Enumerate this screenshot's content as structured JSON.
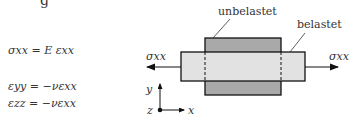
{
  "top_fragment": "g",
  "equations": {
    "stress": "σxx = E εxx",
    "strain_yy": "εyy = −νεxx",
    "strain_zz": "εzz = −νεxx"
  },
  "diagram": {
    "label_unloaded": "unbelastet",
    "label_loaded": "belastet",
    "force_left": "σxx",
    "force_right": "σxx",
    "axis_y": "y",
    "axis_z": "z",
    "axis_x": "x",
    "colors": {
      "unloaded_fill": "#a9a9a9",
      "loaded_fill": "#e2e2e2",
      "stroke": "#111111"
    }
  }
}
